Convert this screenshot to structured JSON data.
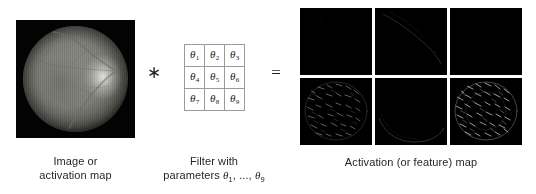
{
  "figure": {
    "type": "convolution-diagram",
    "background_color": "#ffffff",
    "text_color": "#231f20"
  },
  "input": {
    "caption_line1": "Image or",
    "caption_line2": "activation map",
    "image_name": "retinal-fundus-photograph",
    "background_color": "#030303"
  },
  "operators": {
    "convolution": "∗",
    "equals": "="
  },
  "filter": {
    "caption_line1": "Filter with",
    "caption_line2_prefix": "parameters ",
    "caption_line2_math": "θ",
    "caption_line2_sub1": "1",
    "caption_line2_mid": ", ..., ",
    "caption_line2_sub2": "9",
    "rows": [
      [
        {
          "symbol": "θ",
          "index": "1"
        },
        {
          "symbol": "θ",
          "index": "2"
        },
        {
          "symbol": "θ",
          "index": "3"
        }
      ],
      [
        {
          "symbol": "θ",
          "index": "4"
        },
        {
          "symbol": "θ",
          "index": "5"
        },
        {
          "symbol": "θ",
          "index": "6"
        }
      ],
      [
        {
          "symbol": "θ",
          "index": "7"
        },
        {
          "symbol": "θ",
          "index": "8"
        },
        {
          "symbol": "θ",
          "index": "9"
        }
      ]
    ],
    "border_color": "#9b9b9b"
  },
  "output": {
    "caption": "Activation (or feature) map",
    "grid_rows": 2,
    "grid_cols": 3,
    "cells": [
      {
        "id": "act-1",
        "position": "top-left",
        "appearance": "near-black, very faint sparse specks"
      },
      {
        "id": "act-2",
        "position": "top-center",
        "appearance": "near-black, faint diagonal vessel trace"
      },
      {
        "id": "act-3",
        "position": "top-right",
        "appearance": "near-black, almost uniform"
      },
      {
        "id": "act-4",
        "position": "bottom-left",
        "appearance": "dark with bright circular edge texture"
      },
      {
        "id": "act-5",
        "position": "bottom-center",
        "appearance": "near-black, faint lower arc"
      },
      {
        "id": "act-6",
        "position": "bottom-right",
        "appearance": "dark with dense bright radial edge texture"
      }
    ],
    "cell_background_color": "#000000"
  }
}
